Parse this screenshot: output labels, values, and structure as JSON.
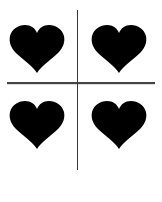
{
  "figure": {
    "colors": {
      "background": "#ffffff",
      "heart_fill": "#000000",
      "divider": "#3a3a3a"
    },
    "hearts": [
      {
        "id": "top-left",
        "icon": "heart-icon",
        "x": 9,
        "y": 24
      },
      {
        "id": "top-right",
        "icon": "heart-icon",
        "x": 91,
        "y": 24
      },
      {
        "id": "bottom-left",
        "icon": "heart-icon",
        "x": 9,
        "y": 100
      },
      {
        "id": "bottom-right",
        "icon": "heart-icon",
        "x": 91,
        "y": 100
      }
    ],
    "dividers": {
      "vertical": {
        "x": 77,
        "y_start": 10,
        "y_end": 170
      },
      "horizontal": {
        "y": 83,
        "x_start": 7,
        "x_end": 155
      }
    }
  }
}
